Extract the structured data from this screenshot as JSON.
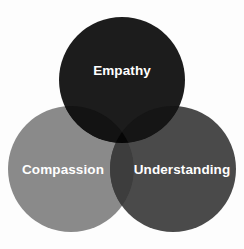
{
  "chart_data": {
    "type": "diagram",
    "diagram_type": "venn",
    "title": "",
    "background_color": "#fdfdfd",
    "sets": [
      {
        "id": "empathy",
        "label": "Empathy",
        "color": "#1c1c1c",
        "label_color": "#ffffff",
        "cx": 122,
        "cy": 80,
        "r": 63,
        "label_x": 122,
        "label_y": 75
      },
      {
        "id": "compassion",
        "label": "Compassion",
        "color": "#8a8a8a",
        "label_color": "#ffffff",
        "cx": 71,
        "cy": 169,
        "r": 63,
        "label_x": 63,
        "label_y": 174
      },
      {
        "id": "understanding",
        "label": "Understanding",
        "color": "#4a4a4a",
        "label_color": "#ffffff",
        "cx": 173,
        "cy": 169,
        "r": 63,
        "label_x": 182,
        "label_y": 174
      }
    ],
    "intersections": [
      {
        "id": "empathy-compassion",
        "color": "#131313"
      },
      {
        "id": "empathy-understanding",
        "color": "#151515"
      },
      {
        "id": "compassion-understanding",
        "color": "#3d3d3d"
      },
      {
        "id": "empathy-compassion-understanding",
        "color": "#060606"
      }
    ]
  },
  "labels": {
    "empathy": "Empathy",
    "compassion": "Compassion",
    "understanding": "Understanding"
  }
}
